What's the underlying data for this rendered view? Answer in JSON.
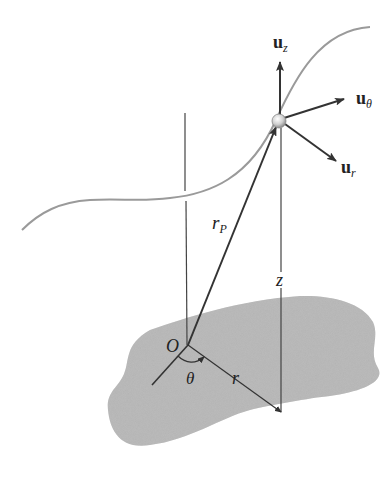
{
  "diagram": {
    "labels": {
      "origin": "O",
      "theta": "θ",
      "r": "r",
      "z": "z",
      "rP_main": "r",
      "rP_sub": "P",
      "uz_main": "u",
      "uz_sub": "z",
      "utheta_main": "u",
      "utheta_sub": "θ",
      "ur_main": "u",
      "ur_sub": "r"
    },
    "colors": {
      "surface": "#b3b3b3",
      "path_curve": "#9a9a9a",
      "lines": "#333333",
      "particle": "#d8d8d8"
    }
  }
}
